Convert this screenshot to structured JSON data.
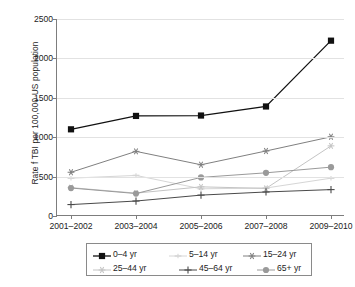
{
  "chart_data": {
    "type": "line",
    "title": "",
    "subtitle": "",
    "xlabel": "",
    "ylabel": "Rate f TBI per 100,000 US population",
    "categories": [
      "2001–2002",
      "2003–2004",
      "2005–2006",
      "2007–2008",
      "2009–2010"
    ],
    "ylim": [
      0,
      2500
    ],
    "yticks": [
      0,
      500,
      1000,
      1500,
      2000,
      2500
    ],
    "ytick_labels": [
      "0",
      "500",
      "1000",
      "1500",
      "2000",
      "2500"
    ],
    "grid": "horizontal",
    "legend_position": "bottom",
    "series": [
      {
        "name": "0–4 yr",
        "marker": "filled-square",
        "color": "#111111",
        "values": [
          1100,
          1270,
          1275,
          1390,
          2225
        ]
      },
      {
        "name": "5–14 yr",
        "marker": "light-dash",
        "color": "#d6d6d6",
        "values": [
          480,
          515,
          345,
          355,
          480
        ]
      },
      {
        "name": "15–24 yr",
        "marker": "asterisk",
        "color": "#808080",
        "values": [
          555,
          820,
          650,
          825,
          1005
        ]
      },
      {
        "name": "25–44 yr",
        "marker": "light-star",
        "color": "#c4c4c4",
        "values": [
          360,
          290,
          370,
          350,
          890
        ]
      },
      {
        "name": "45–64 yr",
        "marker": "plus",
        "color": "#4a4a4a",
        "values": [
          145,
          190,
          265,
          305,
          335
        ]
      },
      {
        "name": "65+ yr",
        "marker": "filled-circle",
        "color": "#9a9a9a",
        "values": [
          355,
          285,
          490,
          548,
          620
        ]
      }
    ]
  },
  "legend": {
    "rows": [
      [
        "0–4 yr",
        "5–14 yr",
        "15–24 yr"
      ],
      [
        "25–44 yr",
        "45–64 yr",
        "65+ yr"
      ]
    ]
  }
}
